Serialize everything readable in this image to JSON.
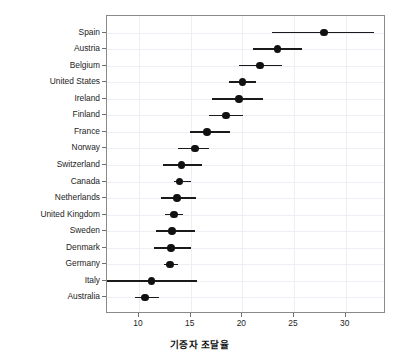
{
  "chart_data": {
    "type": "scatter",
    "title": "",
    "subtitle": "",
    "xlabel": "기증자 조달율",
    "ylabel": "",
    "xlim": [
      6.9,
      33.9
    ],
    "ylim": [
      0,
      17
    ],
    "grid": true,
    "legend": null,
    "orientation": "horizontal",
    "x_ticks": [
      10,
      15,
      20,
      25,
      30
    ],
    "x_tick_labels": [
      "10",
      "15",
      "20",
      "25",
      "30"
    ],
    "categories": [
      "Spain",
      "Austria",
      "Belgium",
      "United States",
      "Ireland",
      "Finland",
      "France",
      "Norway",
      "Switzerland",
      "Canada",
      "Netherlands",
      "United Kingdom",
      "Sweden",
      "Denmark",
      "Germany",
      "Italy",
      "Australia"
    ],
    "values": [
      27.9,
      23.4,
      21.7,
      20.0,
      19.7,
      18.4,
      16.6,
      15.4,
      14.1,
      13.9,
      13.7,
      13.4,
      13.2,
      13.1,
      13.0,
      11.2,
      10.6
    ],
    "errors_low": [
      22.9,
      21.0,
      19.7,
      18.7,
      17.1,
      16.8,
      14.9,
      13.8,
      12.3,
      13.4,
      12.1,
      12.5,
      11.6,
      11.4,
      12.4,
      6.9,
      9.6
    ],
    "errors_high": [
      32.7,
      25.8,
      23.8,
      21.3,
      22.0,
      20.1,
      18.8,
      16.8,
      16.1,
      15.0,
      15.5,
      14.3,
      15.4,
      15.0,
      13.8,
      15.6,
      11.9
    ],
    "marker_color": "#111111",
    "errorbar_color": "#1a1a1a",
    "grid_color": "#eceff3",
    "panel_border_color": "#8a8a8a"
  }
}
